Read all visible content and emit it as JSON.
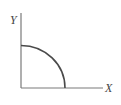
{
  "diagram": {
    "y_axis_label": "Y",
    "x_axis_label": "X",
    "curve": "quarter-circle concave to origin",
    "colors": {
      "axis": "#7a7a7a",
      "curve": "#4a4a4a",
      "label": "#444444",
      "background": "#ffffff"
    }
  }
}
